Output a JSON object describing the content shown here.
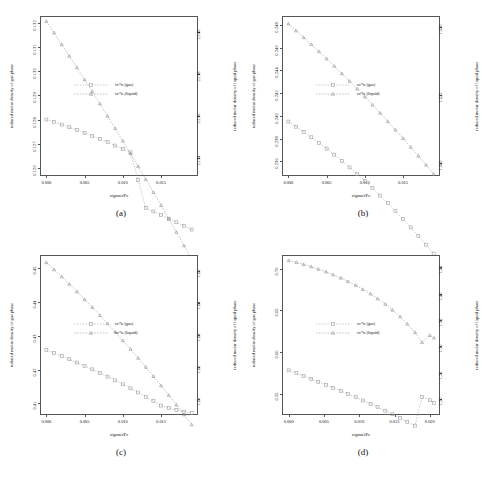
{
  "figure": {
    "layout": "2x2",
    "panels_order": [
      "a",
      "b",
      "c",
      "d"
    ]
  },
  "common": {
    "ylabel_left": "reduced molar density of gas phase",
    "ylabel_right": "reduced molar density of liquid phase",
    "xlabel": "sigma/rPc",
    "legend": [
      {
        "label": "vc*n (gas)",
        "marker": "square",
        "color": "#9a9a9a"
      },
      {
        "label": "vc*n (liquid)",
        "marker": "triangle",
        "color": "#8a8a8a"
      }
    ]
  },
  "chart_data": [
    {
      "type": "line",
      "panel": "a",
      "caption": "(a)",
      "title": "",
      "xlabel": "sigma/rPc",
      "ylabel": "reduced molar density of gas phase",
      "ylabel_right": "reduced molar density of liquid phase",
      "xlim": [
        -0.0007,
        0.0197
      ],
      "xticks": [
        0.0,
        0.005,
        0.01,
        0.015
      ],
      "xticklabels": [
        "0.000",
        "0.005",
        "0.010",
        "0.015"
      ],
      "ylim_left": [
        0.1257,
        0.13225
      ],
      "yticks_left": [
        0.126,
        0.127,
        0.128,
        0.129,
        0.13,
        0.131,
        0.132
      ],
      "yticklabels_left": [
        "0.126",
        "0.127",
        "0.128",
        "0.129",
        "0.130",
        "0.131",
        "0.132"
      ],
      "ylim_right": [
        2.1332,
        2.1407
      ],
      "yticks_right": [
        2.134,
        2.136,
        2.138,
        2.14
      ],
      "yticklabels_right": [
        "2.134",
        "2.136",
        "2.138",
        "2.140"
      ],
      "grid": false,
      "legend_position": "center-left",
      "series": [
        {
          "name": "vc*n (gas)",
          "axis": "left",
          "marker": "square",
          "x": [
            0.0,
            0.001,
            0.002,
            0.003,
            0.004,
            0.005,
            0.006,
            0.007,
            0.008,
            0.009,
            0.01,
            0.011,
            0.012,
            0.013,
            0.014,
            0.015,
            0.016,
            0.017,
            0.018,
            0.019
          ],
          "values": [
            0.128,
            0.1279,
            0.12779,
            0.12768,
            0.12756,
            0.12744,
            0.12732,
            0.12719,
            0.12706,
            0.12692,
            0.12678,
            0.12664,
            0.12549,
            0.12434,
            0.12419,
            0.12404,
            0.12389,
            0.12374,
            0.12359,
            0.12344
          ]
        },
        {
          "name": "vc*n (liquid)",
          "axis": "right",
          "marker": "triangle",
          "x": [
            0.0,
            0.001,
            0.002,
            0.003,
            0.004,
            0.005,
            0.006,
            0.007,
            0.008,
            0.009,
            0.01,
            0.011,
            0.012,
            0.013,
            0.014,
            0.015,
            0.016,
            0.017,
            0.018,
            0.019
          ],
          "values": [
            2.1405,
            2.13995,
            2.1394,
            2.13885,
            2.1383,
            2.13773,
            2.13716,
            2.13658,
            2.136,
            2.13541,
            2.13482,
            2.13422,
            2.13361,
            2.133,
            2.13238,
            2.13176,
            2.13113,
            2.13049,
            2.12985,
            2.1292
          ]
        }
      ]
    },
    {
      "type": "line",
      "panel": "b",
      "caption": "(b)",
      "title": "",
      "xlabel": "sigma/rPc",
      "ylabel": "reduced molar density of gas phase",
      "ylabel_right": "reduced molar density of liquid phase",
      "xlim": [
        -0.0007,
        0.0197
      ],
      "xticks": [
        0.0,
        0.005,
        0.01,
        0.015
      ],
      "xticklabels": [
        "0.000",
        "0.005",
        "0.010",
        "0.015"
      ],
      "ylim_left": [
        0.2348,
        0.2487
      ],
      "yticks_left": [
        0.236,
        0.238,
        0.24,
        0.242,
        0.244,
        0.246,
        0.248
      ],
      "yticklabels_left": [
        "0.236",
        "0.238",
        "0.240",
        "0.242",
        "0.244",
        "0.246",
        "0.248"
      ],
      "ylim_right": [
        1.4955,
        1.5535
      ],
      "yticks_right": [
        1.5,
        1.525,
        1.55
      ],
      "yticklabels_right": [
        "1.500",
        "1.525",
        "1.550"
      ],
      "grid": false,
      "legend_position": "center-left",
      "series": [
        {
          "name": "vc*n (gas)",
          "axis": "left",
          "marker": "square",
          "x": [
            0.0,
            0.001,
            0.002,
            0.003,
            0.004,
            0.005,
            0.006,
            0.007,
            0.008,
            0.009,
            0.01,
            0.011,
            0.012,
            0.013,
            0.014,
            0.015,
            0.016,
            0.017,
            0.018,
            0.019
          ],
          "values": [
            0.2395,
            0.23905,
            0.2386,
            0.23812,
            0.23763,
            0.23712,
            0.23659,
            0.23604,
            0.23547,
            0.23488,
            0.23427,
            0.23364,
            0.23299,
            0.23232,
            0.23163,
            0.23092,
            0.23019,
            0.22944,
            0.22867,
            0.22788
          ]
        },
        {
          "name": "vc*n (liquid)",
          "axis": "right",
          "marker": "triangle",
          "x": [
            0.0,
            0.001,
            0.002,
            0.003,
            0.004,
            0.005,
            0.006,
            0.007,
            0.008,
            0.009,
            0.01,
            0.011,
            0.012,
            0.013,
            0.014,
            0.015,
            0.016,
            0.017,
            0.018,
            0.019
          ],
          "values": [
            1.551,
            1.5485,
            1.546,
            1.54345,
            1.54085,
            1.5382,
            1.5355,
            1.53275,
            1.52995,
            1.5271,
            1.5242,
            1.52125,
            1.51825,
            1.5152,
            1.5121,
            1.50895,
            1.50575,
            1.5025,
            1.4992,
            1.49585
          ]
        }
      ]
    },
    {
      "type": "line",
      "panel": "c",
      "caption": "(c)",
      "title": "",
      "xlabel": "sigma/rPc",
      "ylabel": "reduced molar density of gas phase",
      "ylabel_right": "reduced molar density of liquid phase",
      "xlim": [
        -0.0007,
        0.0197
      ],
      "xticks": [
        0.0,
        0.005,
        0.01,
        0.015
      ],
      "xticklabels": [
        "0.000",
        "0.005",
        "0.010",
        "0.015"
      ],
      "ylim_left": [
        0.4068,
        0.4537
      ],
      "yticks_left": [
        0.41,
        0.42,
        0.43,
        0.44,
        0.45
      ],
      "yticklabels_left": [
        "0.41",
        "0.42",
        "0.43",
        "0.44",
        "0.45"
      ],
      "ylim_right": [
        1.6055,
        1.6545
      ],
      "yticks_right": [
        1.61,
        1.62,
        1.63,
        1.64,
        1.65
      ],
      "yticklabels_right": [
        "1.61",
        "1.62",
        "1.63",
        "1.64",
        "1.65"
      ],
      "grid": false,
      "legend_position": "center-left",
      "series": [
        {
          "name": "vc*n (gas)",
          "axis": "left",
          "marker": "square",
          "x": [
            0.0,
            0.001,
            0.002,
            0.003,
            0.004,
            0.005,
            0.006,
            0.007,
            0.008,
            0.009,
            0.01,
            0.011,
            0.012,
            0.013,
            0.014,
            0.015,
            0.016,
            0.017,
            0.018,
            0.019
          ],
          "values": [
            0.4258,
            0.4249,
            0.424,
            0.42305,
            0.42208,
            0.42108,
            0.42005,
            0.419,
            0.4179,
            0.41678,
            0.41562,
            0.41443,
            0.4132,
            0.41194,
            0.41064,
            0.4093,
            0.4086,
            0.408,
            0.4075,
            0.4071
          ]
        },
        {
          "name": "vc*n (liquid)",
          "axis": "right",
          "marker": "triangle",
          "x": [
            0.0,
            0.001,
            0.002,
            0.003,
            0.004,
            0.005,
            0.006,
            0.007,
            0.008,
            0.009,
            0.01,
            0.011,
            0.012,
            0.013,
            0.014,
            0.015,
            0.016,
            0.017,
            0.018,
            0.019
          ],
          "values": [
            1.6525,
            1.6503,
            1.6481,
            1.6458,
            1.64345,
            1.64105,
            1.6386,
            1.6361,
            1.63355,
            1.63095,
            1.6283,
            1.6256,
            1.62285,
            1.62005,
            1.6172,
            1.6143,
            1.61135,
            1.60835,
            1.6053,
            1.6022
          ]
        }
      ]
    },
    {
      "type": "line",
      "panel": "d",
      "caption": "(d)",
      "title": "",
      "xlabel": "sigma/rPc",
      "ylabel": "reduced molar density of gas phase",
      "ylabel_right": "reduced molar density of liquid phase",
      "xlim": [
        -0.0008,
        0.0213
      ],
      "xticks": [
        0.0,
        0.005,
        0.01,
        0.015,
        0.02
      ],
      "xticklabels": [
        "0.000",
        "0.005",
        "0.010",
        "0.015",
        "0.020"
      ],
      "ylim_left": [
        0.5255,
        0.7155
      ],
      "yticks_left": [
        0.55,
        0.6,
        0.65,
        0.7
      ],
      "yticklabels_left": [
        "0.55",
        "0.60",
        "0.65",
        "0.70"
      ],
      "ylim_right": [
        1.1715,
        1.4715
      ],
      "yticks_right": [
        1.2,
        1.25,
        1.3,
        1.35,
        1.4,
        1.45
      ],
      "yticklabels_right": [
        "1.20",
        "1.25",
        "1.30",
        "1.35",
        "1.40",
        "1.45"
      ],
      "grid": false,
      "legend_position": "center-left",
      "series": [
        {
          "name": "vc*n (gas)",
          "axis": "left",
          "marker": "square",
          "x": [
            0.0,
            0.0011,
            0.0021,
            0.0032,
            0.0042,
            0.0053,
            0.0063,
            0.0074,
            0.0084,
            0.0095,
            0.0105,
            0.0116,
            0.0126,
            0.0137,
            0.0147,
            0.0158,
            0.0168,
            0.0179,
            0.0189,
            0.02,
            0.0206
          ],
          "values": [
            0.578,
            0.5746,
            0.5712,
            0.5677,
            0.5642,
            0.5606,
            0.557,
            0.5533,
            0.5495,
            0.5457,
            0.5418,
            0.5378,
            0.5337,
            0.5295,
            0.5252,
            0.5208,
            0.5162,
            0.5115,
            0.546,
            0.542,
            0.539
          ]
        },
        {
          "name": "vc*n (liquid)",
          "axis": "right",
          "marker": "triangle",
          "x": [
            0.0,
            0.0011,
            0.0021,
            0.0032,
            0.0042,
            0.0053,
            0.0063,
            0.0074,
            0.0084,
            0.0095,
            0.0105,
            0.0116,
            0.0126,
            0.0137,
            0.0147,
            0.0158,
            0.0168,
            0.0179,
            0.0189,
            0.02,
            0.0206
          ],
          "values": [
            1.463,
            1.4595,
            1.4556,
            1.4513,
            1.4466,
            1.4415,
            1.4359,
            1.4298,
            1.4232,
            1.416,
            1.4082,
            1.3997,
            1.3904,
            1.3802,
            1.369,
            1.3565,
            1.3425,
            1.3265,
            1.3075,
            1.321,
            1.316
          ]
        }
      ]
    }
  ]
}
